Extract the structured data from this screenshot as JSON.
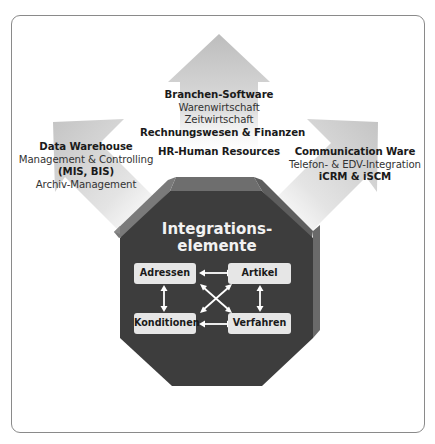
{
  "diagram": {
    "top": {
      "title": "Branchen-Software",
      "lines": [
        "Warenwirtschaft",
        "Zeitwirtschaft"
      ],
      "bold_line": "Rechnungswesen & Finanzen",
      "extra": "HR-Human Resources"
    },
    "left": {
      "title": "Data Warehouse",
      "line1": "Management & Controlling",
      "bold_line": "(MIS, BIS)",
      "line2": "Archiv-Management"
    },
    "right": {
      "title": "Communication Ware",
      "line1": "Telefon- & EDV-Integration",
      "bold_line": "iCRM & iSCM"
    },
    "center": {
      "title_line1": "Integrations-",
      "title_line2": "elemente",
      "boxes": {
        "top_left": "Adressen",
        "top_right": "Artikel",
        "bottom_left": "Konditionen",
        "bottom_right": "Verfahren"
      }
    },
    "colors": {
      "octagon": "#3d3d3d",
      "octagon_bevel": "#6a6a6a",
      "arrow_gray": "#c9c9c9",
      "box_fill": "#e6e6e6",
      "frame_border": "#8a8a8a"
    }
  }
}
